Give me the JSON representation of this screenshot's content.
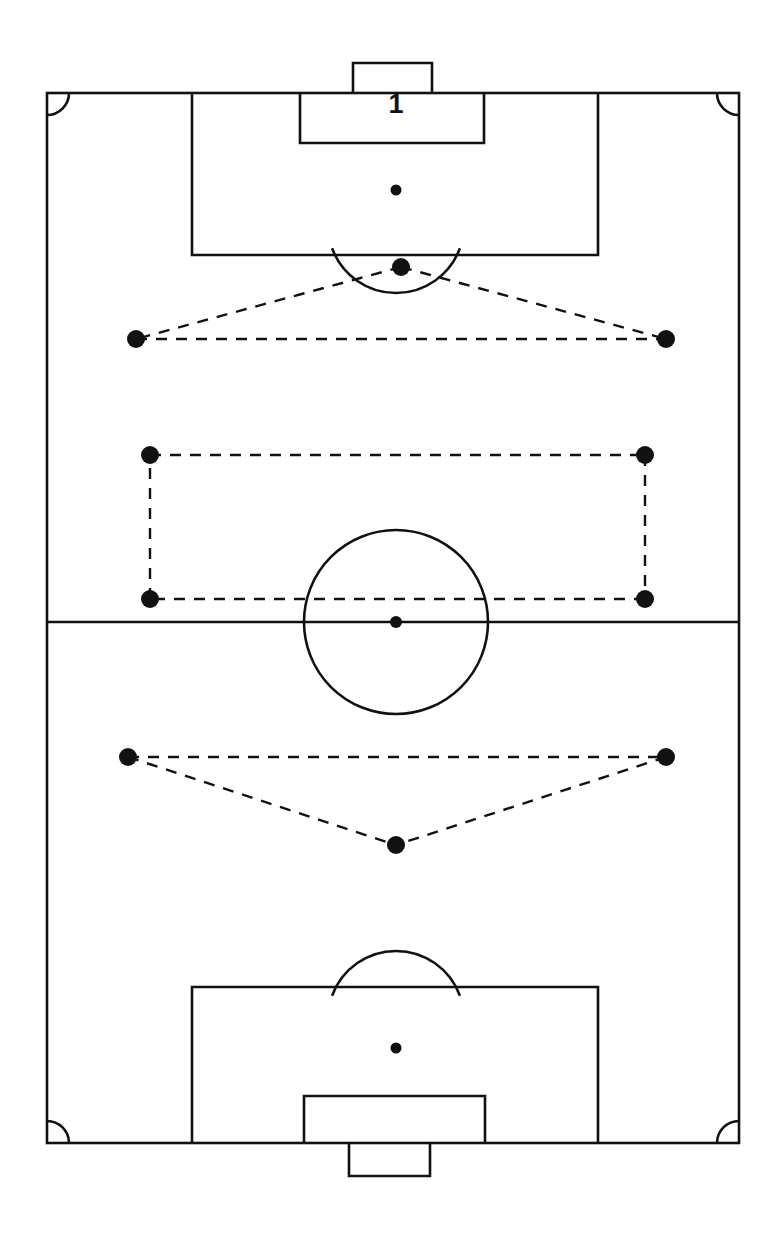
{
  "diagram": {
    "type": "tactical-formation",
    "orientation": "vertical",
    "background_color": "#ffffff",
    "line_color": "#111111",
    "marker_color": "#111111"
  },
  "pitch": {
    "left": 47,
    "top": 93,
    "right": 739,
    "bottom": 1143,
    "halfway_line_y": 622,
    "corner_arc_radius": 22,
    "center_circle": {
      "cx": 396,
      "cy": 622,
      "r": 92
    },
    "center_spot": {
      "cx": 396,
      "cy": 622,
      "r": 6
    },
    "top_half": {
      "penalty_area": {
        "x1": 192,
        "y1": 93,
        "x2": 598,
        "y2": 255
      },
      "goal_area": {
        "x1": 300,
        "y1": 93,
        "x2": 484,
        "y2": 143
      },
      "goal": {
        "x1": 353,
        "y1": 63,
        "x2": 432,
        "y2": 93
      },
      "penalty_spot": {
        "cx": 396,
        "cy": 190,
        "r": 5.5
      },
      "penalty_arc": {
        "cx": 396,
        "cy": 225,
        "r": 68,
        "from_deg": 20,
        "to_deg": 160
      }
    },
    "bottom_half": {
      "penalty_area": {
        "x1": 192,
        "y1": 987,
        "x2": 598,
        "y2": 1143
      },
      "goal_area": {
        "x1": 304,
        "y1": 1096,
        "x2": 485,
        "y2": 1143
      },
      "goal": {
        "x1": 349,
        "y1": 1143,
        "x2": 430,
        "y2": 1176
      },
      "penalty_spot": {
        "cx": 396,
        "cy": 1048,
        "r": 5.5
      },
      "penalty_arc": {
        "cx": 396,
        "cy": 1019,
        "r": 68,
        "from_deg": 200,
        "to_deg": 340
      }
    }
  },
  "goalkeeper": {
    "number_label": "1",
    "number_x": 396,
    "number_y": 106
  },
  "players": [
    {
      "id": "p1",
      "label": "striker-center",
      "cx": 401,
      "cy": 267,
      "r": 9
    },
    {
      "id": "p2",
      "label": "winger-left",
      "cx": 136,
      "cy": 339,
      "r": 9
    },
    {
      "id": "p3",
      "label": "winger-right",
      "cx": 666,
      "cy": 339,
      "r": 9
    },
    {
      "id": "p4",
      "label": "midfield-left-high",
      "cx": 150,
      "cy": 455,
      "r": 9
    },
    {
      "id": "p5",
      "label": "midfield-right-high",
      "cx": 645,
      "cy": 455,
      "r": 9
    },
    {
      "id": "p6",
      "label": "midfield-left-low",
      "cx": 150,
      "cy": 599,
      "r": 9
    },
    {
      "id": "p7",
      "label": "midfield-right-low",
      "cx": 645,
      "cy": 599,
      "r": 9
    },
    {
      "id": "p8",
      "label": "defender-left",
      "cx": 128,
      "cy": 757,
      "r": 9
    },
    {
      "id": "p9",
      "label": "defender-right",
      "cx": 666,
      "cy": 757,
      "r": 9
    },
    {
      "id": "p10",
      "label": "sweeper-center",
      "cx": 396,
      "cy": 845,
      "r": 9
    }
  ],
  "connections": [
    {
      "id": "c1",
      "label": "forward-unit-left",
      "x1": 401,
      "y1": 267,
      "x2": 136,
      "y2": 339
    },
    {
      "id": "c2",
      "label": "forward-unit-right",
      "x1": 401,
      "y1": 267,
      "x2": 666,
      "y2": 339
    },
    {
      "id": "c3",
      "label": "forward-unit-base",
      "x1": 136,
      "y1": 339,
      "x2": 666,
      "y2": 339
    },
    {
      "id": "c4",
      "label": "midfield-box-top",
      "x1": 150,
      "y1": 455,
      "x2": 645,
      "y2": 455
    },
    {
      "id": "c5",
      "label": "midfield-box-right",
      "x1": 645,
      "y1": 455,
      "x2": 645,
      "y2": 599
    },
    {
      "id": "c6",
      "label": "midfield-box-bottom",
      "x1": 645,
      "y1": 599,
      "x2": 150,
      "y2": 599
    },
    {
      "id": "c7",
      "label": "midfield-box-left",
      "x1": 150,
      "y1": 599,
      "x2": 150,
      "y2": 455
    },
    {
      "id": "c8",
      "label": "defence-unit-top",
      "x1": 128,
      "y1": 757,
      "x2": 666,
      "y2": 757
    },
    {
      "id": "c9",
      "label": "defence-unit-left",
      "x1": 128,
      "y1": 757,
      "x2": 396,
      "y2": 845
    },
    {
      "id": "c10",
      "label": "defence-unit-right",
      "x1": 666,
      "y1": 757,
      "x2": 396,
      "y2": 845
    }
  ]
}
